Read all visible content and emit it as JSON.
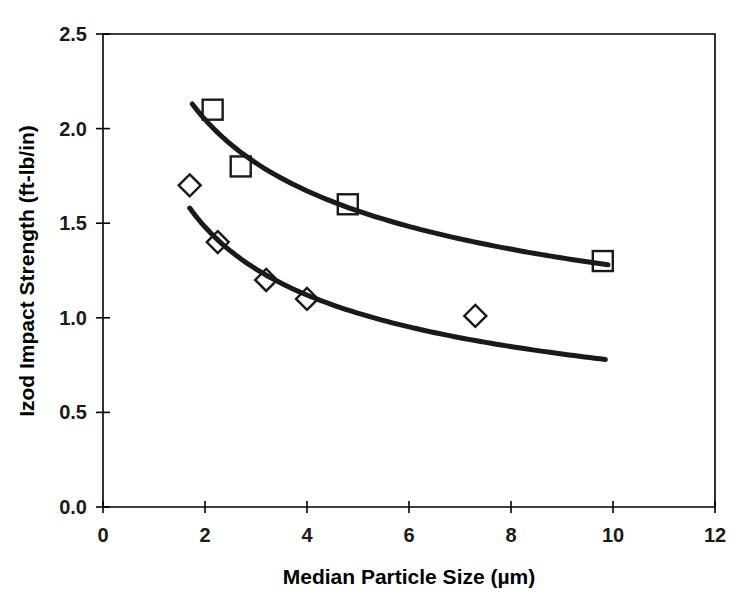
{
  "chart_data": {
    "type": "scatter",
    "title": "",
    "xlabel": "Median Particle Size (µm)",
    "ylabel": "Izod Impact Strength (ft-lb/in)",
    "xlim": [
      0,
      12
    ],
    "ylim": [
      0.0,
      2.5
    ],
    "xticks": [
      0,
      2,
      4,
      6,
      8,
      10,
      12
    ],
    "yticks": [
      0.0,
      0.5,
      1.0,
      1.5,
      2.0,
      2.5
    ],
    "xtick_labels": [
      "0",
      "2",
      "4",
      "6",
      "8",
      "10",
      "12"
    ],
    "ytick_labels": [
      "0.0",
      "0.5",
      "1.0",
      "1.5",
      "2.0",
      "2.5"
    ],
    "grid": false,
    "legend": "none",
    "marker_color": "#1a1a1a",
    "curve_color": "#1a1a1a",
    "background": "#ffffff",
    "series": [
      {
        "name": "upper-series",
        "marker": "square",
        "points": [
          {
            "x": 2.15,
            "y": 2.1
          },
          {
            "x": 2.7,
            "y": 1.8
          },
          {
            "x": 4.8,
            "y": 1.6
          },
          {
            "x": 9.8,
            "y": 1.3
          }
        ],
        "trend": {
          "x_start": 1.75,
          "x_end": 9.9,
          "y_start": 2.13,
          "y_end": 1.28,
          "fit": "power"
        }
      },
      {
        "name": "lower-series",
        "marker": "diamond",
        "points": [
          {
            "x": 1.7,
            "y": 1.7
          },
          {
            "x": 2.25,
            "y": 1.4
          },
          {
            "x": 3.2,
            "y": 1.2
          },
          {
            "x": 4.0,
            "y": 1.1
          },
          {
            "x": 7.3,
            "y": 1.01
          }
        ],
        "trend": {
          "x_start": 1.7,
          "x_end": 9.85,
          "y_start": 1.58,
          "y_end": 0.78,
          "fit": "power"
        }
      }
    ]
  },
  "axes": {
    "x_title": "Median Particle Size (µm)",
    "y_title": "Izod Impact Strength (ft-lb/in)"
  }
}
